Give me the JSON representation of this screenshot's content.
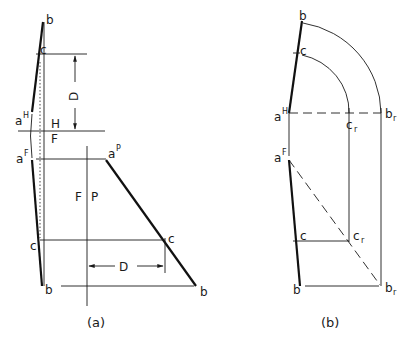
{
  "figure": {
    "view_a": {
      "caption": "(a)",
      "labels": {
        "b_top": "b",
        "c_top": "c",
        "aH": "a",
        "aH_sup": "H",
        "aF": "a",
        "aF_sup": "F",
        "c_bottom": "c",
        "b_bottom": "b",
        "H_ref": "H",
        "F_ref": "F",
        "F_ref2": "F",
        "P_ref": "P",
        "aP": "a",
        "aP_sup": "P",
        "c_profile": "c",
        "b_profile": "b",
        "dim_vertical": "D",
        "dim_horizontal": "D"
      }
    },
    "view_b": {
      "caption": "(b)",
      "labels": {
        "b_top": "b",
        "c_top": "c",
        "aH": "a",
        "aH_sup": "H",
        "br_top": "b",
        "br_top_sub": "r",
        "cr_top": "c",
        "cr_top_sub": "r",
        "aF": "a",
        "aF_sup": "F",
        "c_bottom": "c",
        "cr_bottom": "c",
        "cr_bottom_sub": "r",
        "b_bottom": "b",
        "br_bottom": "b",
        "br_bottom_sub": "r"
      }
    },
    "colors": {
      "ink": "#1a1a1a",
      "background": "#ffffff"
    }
  }
}
